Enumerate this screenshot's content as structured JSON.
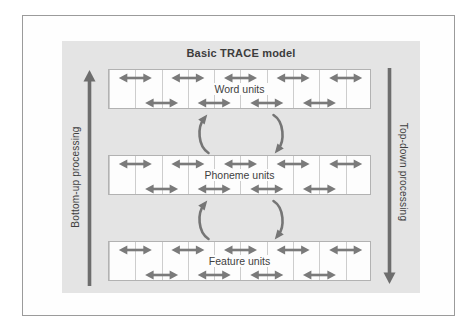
{
  "figure": {
    "edge_label_fragment": ")"
  },
  "diagram": {
    "title": "Basic TRACE model",
    "left_process_label": "Bottom-up processing",
    "right_process_label": "Top-down processing",
    "layers": [
      {
        "label": "Word units"
      },
      {
        "label": "Phoneme units"
      },
      {
        "label": "Feature units"
      }
    ],
    "icons": {
      "within_layer": "bidirectional-horizontal-arrow",
      "between_layers_left": "curved-arrow-up",
      "between_layers_right": "curved-arrow-down",
      "left_side": "vertical-arrow-up",
      "right_side": "vertical-arrow-down"
    },
    "colors": {
      "panel_bg": "#e4e4e4",
      "box_bg": "#fdfdfd",
      "box_border": "#b2b2b2",
      "cell_line": "#cdcdcd",
      "bidirectional_arrow": "#7a7a7a",
      "curved_arrow": "#757575",
      "side_arrow": "#6d6d6d",
      "text": "#3f3f3f",
      "frame_border": "#9b9b9b"
    }
  }
}
